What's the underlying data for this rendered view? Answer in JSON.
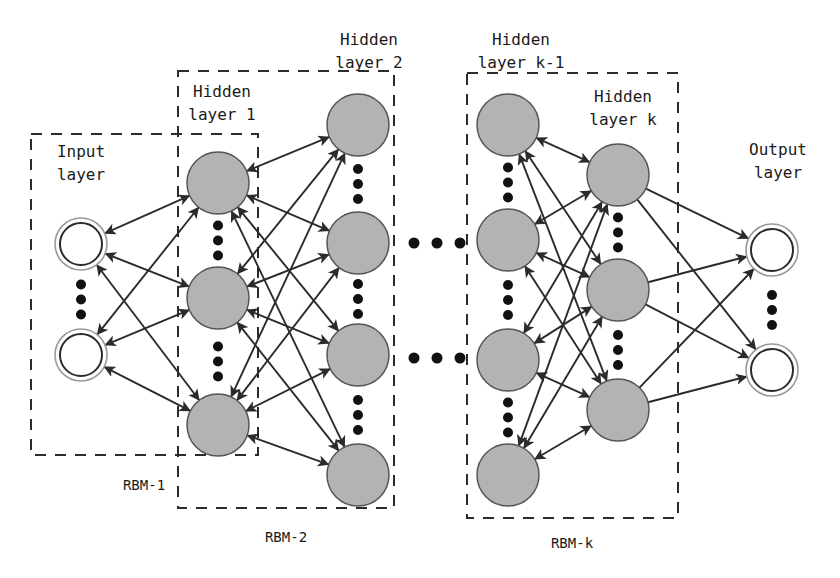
{
  "figure": {
    "background": "#ffffff",
    "stroke_color": "#2b2b2b",
    "hidden_node_fill": "#b3b3b3",
    "io_node_fill": "#ffffff"
  },
  "layer_labels": {
    "input": {
      "line1": "Input",
      "line2": "layer"
    },
    "hidden1": {
      "line1": "Hidden",
      "line2": "layer 1"
    },
    "hidden2": {
      "line1": "Hidden",
      "line2": "layer 2"
    },
    "hidden_k_minus_1": {
      "line1": "Hidden",
      "line2": "layer k-1"
    },
    "hidden_k": {
      "line1": "Hidden",
      "line2": "layer k"
    },
    "output": {
      "line1": "Output",
      "line2": "layer"
    }
  },
  "rbm_labels": [
    {
      "id": "rbm-1",
      "text": "RBM-1"
    },
    {
      "id": "rbm-2",
      "text": "RBM-2"
    },
    {
      "id": "rbm-k",
      "text": "RBM-k"
    }
  ],
  "layers": [
    {
      "id": "input",
      "cx": 81,
      "r": 26,
      "style": "ring",
      "nodes_y": [
        244,
        355
      ],
      "vdots_y": [
        287,
        302,
        317
      ]
    },
    {
      "id": "hidden-1",
      "cx": 218,
      "r": 31,
      "style": "solid",
      "nodes_y": [
        183,
        298,
        425
      ],
      "vdots_y": [
        236,
        251,
        266
      ]
    },
    {
      "id": "hidden-2",
      "cx": 358,
      "r": 31,
      "style": "solid",
      "nodes_y": [
        125,
        243,
        355,
        475
      ],
      "vdots_y": [
        169,
        184,
        199
      ]
    },
    {
      "id": "hidden-k-minus-1",
      "cx": 508,
      "r": 31,
      "style": "solid",
      "nodes_y": [
        125,
        240,
        360,
        475
      ],
      "vdots_y": [
        169,
        184,
        199
      ]
    },
    {
      "id": "hidden-k",
      "cx": 618,
      "r": 31,
      "style": "solid",
      "nodes_y": [
        175,
        290,
        410
      ],
      "vdots_y": [
        225,
        240,
        255
      ]
    },
    {
      "id": "output",
      "cx": 772,
      "r": 26,
      "style": "ring",
      "nodes_y": [
        250,
        370
      ],
      "vdots_y": [
        293,
        308,
        323
      ]
    }
  ],
  "rbm_boxes": [
    {
      "id": "rbm-1",
      "x": 31,
      "y": 134,
      "w": 227,
      "h": 321,
      "label_x": 144,
      "label_y": 490
    },
    {
      "id": "rbm-2",
      "x": 178,
      "y": 71,
      "w": 216,
      "h": 437,
      "label_x": 286,
      "label_y": 542
    },
    {
      "id": "rbm-k",
      "x": 467,
      "y": 73,
      "w": 211,
      "h": 445,
      "label_x": 572,
      "label_y": 548
    }
  ],
  "ellipsis_between": {
    "note": "horizontal dots indicating omitted layers",
    "rows": [
      {
        "y": 243,
        "xs": [
          414,
          437,
          460
        ]
      },
      {
        "y": 358,
        "xs": [
          414,
          437,
          460
        ]
      }
    ]
  },
  "label_positions": {
    "input": {
      "x": 81,
      "y": 157,
      "y2": 180
    },
    "hidden1": {
      "x": 222,
      "y": 97,
      "y2": 120
    },
    "hidden2": {
      "x": 369,
      "y": 45,
      "y2": 68
    },
    "hidden_k_minus_1": {
      "x": 521,
      "y": 45,
      "y2": 68
    },
    "hidden_k": {
      "x": 623,
      "y": 102,
      "y2": 125
    },
    "output": {
      "x": 778,
      "y": 155,
      "y2": 178
    }
  },
  "connections": {
    "input_hidden1": {
      "bidirectional": true
    },
    "hidden1_hidden2": {
      "bidirectional": true
    },
    "hiddenk1_hiddenk": {
      "bidirectional": true
    },
    "hiddenk_output": {
      "bidirectional": false
    }
  }
}
